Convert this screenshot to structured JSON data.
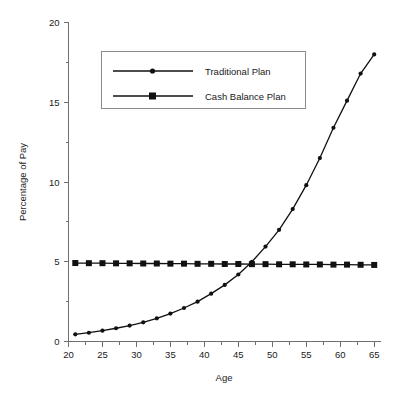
{
  "chart_data": {
    "type": "line",
    "title": "",
    "xlabel": "Age",
    "ylabel": "Percentage of Pay",
    "xlim": [
      20,
      66
    ],
    "ylim": [
      0,
      20
    ],
    "xticks": [
      20,
      25,
      30,
      35,
      40,
      45,
      50,
      55,
      60,
      65
    ],
    "yticks": [
      0,
      5,
      10,
      15,
      20
    ],
    "xtick_labels": [
      "20",
      "25",
      "30",
      "35",
      "40",
      "45",
      "50",
      "55",
      "60",
      "65"
    ],
    "ytick_labels": [
      "0",
      "5",
      "10",
      "15",
      "20"
    ],
    "x_minor_ticks": [
      22.5,
      27.5,
      32.5,
      37.5,
      42.5,
      47.5,
      52.5,
      57.5,
      62.5
    ],
    "y_minor_ticks": [
      2.5,
      7.5,
      12.5,
      17.5
    ],
    "grid": false,
    "legend_position": "upper-left-inside",
    "x": [
      21,
      23,
      25,
      27,
      29,
      31,
      33,
      35,
      37,
      39,
      41,
      43,
      45,
      47,
      49,
      51,
      53,
      55,
      57,
      59,
      61,
      63,
      65
    ],
    "series": [
      {
        "name": "Traditional Plan",
        "marker": "circle",
        "values": [
          0.45,
          0.55,
          0.68,
          0.83,
          1.0,
          1.2,
          1.45,
          1.75,
          2.1,
          2.5,
          3.0,
          3.55,
          4.2,
          5.0,
          5.95,
          7.0,
          8.3,
          9.8,
          11.5,
          13.4,
          15.1,
          16.8,
          18.0
        ]
      },
      {
        "name": "Cash Balance Plan",
        "marker": "square",
        "values": [
          4.92,
          4.91,
          4.91,
          4.9,
          4.9,
          4.89,
          4.89,
          4.88,
          4.88,
          4.87,
          4.87,
          4.86,
          4.86,
          4.85,
          4.85,
          4.84,
          4.84,
          4.83,
          4.83,
          4.82,
          4.82,
          4.81,
          4.8
        ]
      }
    ],
    "annotations": []
  },
  "legend": {
    "entries": [
      {
        "label": "Traditional Plan",
        "marker": "circle"
      },
      {
        "label": "Cash Balance Plan",
        "marker": "square"
      }
    ]
  },
  "colors": {
    "series_stroke": "#111111",
    "axis": "#6f6f6f",
    "legend_border": "#8a8a8a",
    "background": "#ffffff",
    "text": "#1a1a1a"
  }
}
